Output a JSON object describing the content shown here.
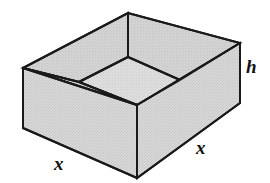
{
  "figure": {
    "shape_name": "open-box-3d",
    "projection": "oblique",
    "colors": {
      "fill": "#d6d6d6",
      "fill_inner_floor": "#dcdcdc",
      "fill_back_wall": "#d2d2d2",
      "stroke": "#1a1a1a",
      "background": "#ffffff"
    },
    "labels": {
      "x_left": "x",
      "x_right": "x",
      "h": "h"
    },
    "geometry": {
      "outer_back_apex": [
        128,
        13
      ],
      "outer_left_top": [
        23,
        68
      ],
      "outer_right_top": [
        240,
        43
      ],
      "outer_front_top": [
        137,
        105
      ],
      "outer_left_bottom": [
        23,
        128
      ],
      "outer_right_bottom": [
        240,
        103
      ],
      "outer_front_bottom": [
        137,
        178
      ],
      "inner_left": [
        79,
        82
      ],
      "inner_front": [
        137,
        105
      ],
      "inner_right": [
        180,
        80
      ],
      "inner_back": [
        128,
        57
      ]
    }
  }
}
